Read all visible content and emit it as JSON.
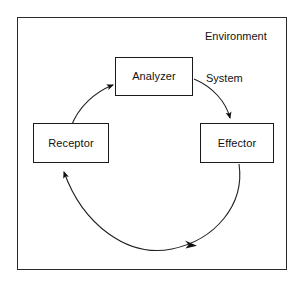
{
  "diagram": {
    "title_label": "Environment",
    "inner_label": "System",
    "nodes": [
      {
        "id": "analyzer",
        "label": "Analyzer"
      },
      {
        "id": "receptor",
        "label": "Receptor"
      },
      {
        "id": "effector",
        "label": "Effector"
      }
    ],
    "edges": [
      {
        "id": "receptor-to-analyzer",
        "from": "Receptor",
        "to": "Analyzer",
        "style": "curved-arrow"
      },
      {
        "id": "analyzer-to-effector",
        "from": "Analyzer",
        "to": "Effector",
        "style": "curved-arrow"
      },
      {
        "id": "effector-to-receptor",
        "from": "Effector",
        "to": "Receptor",
        "style": "curved-arrow"
      }
    ],
    "colors": {
      "frame_stroke": "#2b2b2b",
      "box_stroke": "#1a1a1a",
      "arc_stroke": "#222222",
      "text": "#111111",
      "background": "#ffffff"
    }
  }
}
